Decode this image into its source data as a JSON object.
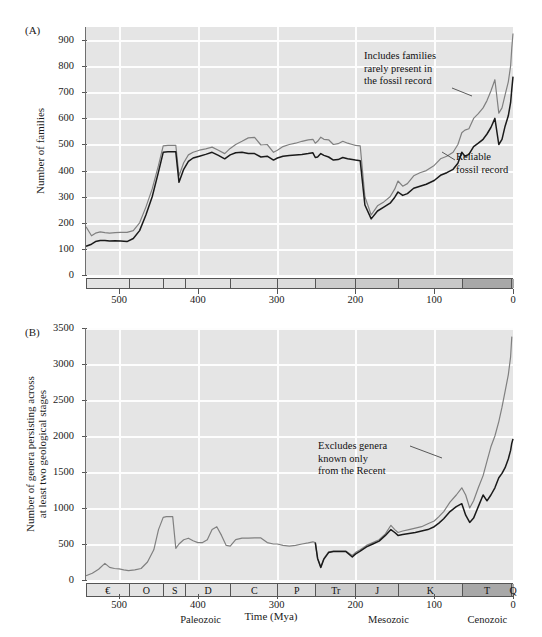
{
  "figure": {
    "panelA_label": "(A)",
    "panelB_label": "(B)",
    "xaxis_title": "Time (Mya)"
  },
  "panelA": {
    "ylabel": "Number of families",
    "yticks": [
      "0",
      "100",
      "200",
      "300",
      "400",
      "500",
      "600",
      "700",
      "800",
      "900"
    ],
    "xticks": [
      "500",
      "400",
      "300",
      "200",
      "100",
      "0"
    ],
    "annotation_upper": "Includes families rarely present in the fossil record",
    "annotation_upper_lines": [
      "Includes families",
      "rarely present in",
      "the fossil record"
    ],
    "annotation_lower": "Reliable fossil record",
    "annotation_lower_lines": [
      "Reliable",
      "fossil record"
    ]
  },
  "panelB": {
    "ylabel": "Number of genera persisting across at least two geological stages",
    "ylabel_lines": [
      "Number of genera persisting across",
      "at least two geological stages"
    ],
    "yticks": [
      "0",
      "500",
      "1000",
      "1500",
      "2000",
      "2500",
      "3000",
      "3500"
    ],
    "xticks": [
      "500",
      "400",
      "300",
      "200",
      "100",
      "0"
    ],
    "annotation": "Excludes genera known only from the Recent",
    "annotation_lines": [
      "Excludes genera",
      "known only",
      "from the Recent"
    ]
  },
  "timescale": {
    "periods": [
      {
        "abbr": "€",
        "name": "Cambrian",
        "start": 542,
        "end": 488,
        "shade": "#e3e3e3"
      },
      {
        "abbr": "O",
        "name": "Ordovician",
        "start": 488,
        "end": 444,
        "shade": "#e3e3e3"
      },
      {
        "abbr": "S",
        "name": "Silurian",
        "start": 444,
        "end": 416,
        "shade": "#e3e3e3"
      },
      {
        "abbr": "D",
        "name": "Devonian",
        "start": 416,
        "end": 359,
        "shade": "#e1e1e1"
      },
      {
        "abbr": "C",
        "name": "Carboniferous",
        "start": 359,
        "end": 299,
        "shade": "#dedede"
      },
      {
        "abbr": "P",
        "name": "Permian",
        "start": 299,
        "end": 251,
        "shade": "#dcdcdc"
      },
      {
        "abbr": "Tr",
        "name": "Triassic",
        "start": 251,
        "end": 200,
        "shade": "#cdcdcd"
      },
      {
        "abbr": "J",
        "name": "Jurassic",
        "start": 200,
        "end": 146,
        "shade": "#cacaca"
      },
      {
        "abbr": "K",
        "name": "Cretaceous",
        "start": 146,
        "end": 65,
        "shade": "#c8c8c8"
      },
      {
        "abbr": "T",
        "name": "Tertiary",
        "start": 65,
        "end": 2,
        "shade": "#a8a8a8"
      },
      {
        "abbr": "Q",
        "name": "Quaternary",
        "start": 2,
        "end": 0,
        "shade": "#a8a8a8"
      }
    ],
    "eras": [
      {
        "label": "Paleozoic",
        "start": 542,
        "end": 251
      },
      {
        "label": "Mesozoic",
        "start": 251,
        "end": 65
      },
      {
        "label": "Cenozoic",
        "start": 65,
        "end": 0
      }
    ]
  },
  "colors": {
    "plot_background": "#e5e5e5",
    "gridline": "#fdfdfd",
    "curve_total": "#808080",
    "curve_reliable": "#1a1a1a",
    "axis": "#6f6f6f"
  },
  "chart_data": [
    {
      "type": "line",
      "title": "(A) Number of families through geological time",
      "xlabel": "Time (Mya)",
      "ylabel": "Number of families",
      "xlim": [
        542,
        0
      ],
      "ylim": [
        0,
        950
      ],
      "xticks": [
        500,
        400,
        300,
        200,
        100,
        0
      ],
      "yticks": [
        0,
        100,
        200,
        300,
        400,
        500,
        600,
        700,
        800,
        900
      ],
      "grid": true,
      "x_reversed": true,
      "legend": "inline-annotations",
      "series": [
        {
          "name": "Includes families rarely present in the fossil record",
          "color": "#808080",
          "x": [
            542,
            535,
            530,
            524,
            518,
            512,
            505,
            498,
            490,
            482,
            474,
            466,
            458,
            450,
            444,
            438,
            432,
            428,
            424,
            418,
            412,
            406,
            398,
            390,
            382,
            374,
            366,
            359,
            352,
            344,
            336,
            328,
            320,
            312,
            304,
            299,
            292,
            284,
            276,
            268,
            260,
            254,
            251,
            248,
            244,
            240,
            234,
            228,
            222,
            216,
            210,
            204,
            200,
            194,
            188,
            180,
            172,
            164,
            156,
            150,
            146,
            140,
            134,
            126,
            118,
            110,
            100,
            92,
            84,
            76,
            70,
            65,
            61,
            56,
            50,
            44,
            38,
            33,
            28,
            23,
            18,
            14,
            10,
            6,
            3,
            1.5,
            0
          ],
          "y": [
            185,
            150,
            160,
            165,
            162,
            160,
            162,
            163,
            163,
            170,
            200,
            260,
            330,
            420,
            495,
            497,
            497,
            497,
            380,
            430,
            460,
            470,
            478,
            483,
            490,
            478,
            465,
            485,
            500,
            512,
            525,
            527,
            498,
            500,
            470,
            478,
            492,
            500,
            505,
            512,
            518,
            520,
            505,
            512,
            528,
            520,
            518,
            500,
            503,
            512,
            505,
            500,
            497,
            495,
            300,
            230,
            265,
            280,
            300,
            330,
            360,
            340,
            350,
            380,
            392,
            400,
            420,
            445,
            455,
            470,
            500,
            545,
            555,
            560,
            600,
            618,
            640,
            668,
            705,
            748,
            620,
            640,
            690,
            740,
            800,
            870,
            925
          ],
          "notes": "Gray upper curve: total family diversity including taxa rarely preserved."
        },
        {
          "name": "Reliable fossil record",
          "color": "#1a1a1a",
          "x": [
            542,
            535,
            530,
            524,
            518,
            512,
            505,
            498,
            490,
            482,
            474,
            466,
            458,
            450,
            444,
            438,
            432,
            428,
            424,
            418,
            412,
            406,
            398,
            390,
            382,
            374,
            366,
            359,
            352,
            344,
            336,
            328,
            320,
            312,
            304,
            299,
            292,
            284,
            276,
            268,
            260,
            254,
            251,
            248,
            244,
            240,
            234,
            228,
            222,
            216,
            210,
            204,
            200,
            194,
            188,
            180,
            172,
            164,
            156,
            150,
            146,
            140,
            134,
            126,
            118,
            110,
            100,
            92,
            84,
            76,
            70,
            65,
            61,
            56,
            50,
            44,
            38,
            33,
            28,
            23,
            18,
            14,
            10,
            6,
            3,
            1.5,
            0
          ],
          "y": [
            110,
            118,
            128,
            132,
            132,
            130,
            131,
            130,
            128,
            140,
            170,
            230,
            300,
            395,
            470,
            472,
            472,
            472,
            355,
            405,
            435,
            448,
            455,
            462,
            470,
            458,
            445,
            460,
            468,
            470,
            465,
            465,
            452,
            455,
            440,
            448,
            455,
            458,
            460,
            462,
            465,
            468,
            450,
            452,
            465,
            458,
            452,
            440,
            442,
            450,
            445,
            442,
            440,
            438,
            268,
            215,
            245,
            260,
            275,
            298,
            318,
            305,
            312,
            332,
            340,
            348,
            362,
            382,
            392,
            405,
            428,
            470,
            455,
            462,
            492,
            505,
            520,
            540,
            565,
            600,
            500,
            520,
            570,
            610,
            660,
            712,
            760
          ],
          "notes": "Black lower curve: families with a reliable fossil record."
        }
      ],
      "annotations": [
        {
          "text": "Includes families rarely present in the fossil record",
          "points_to_series": "Includes families rarely present in the fossil record",
          "x_at": 45
        },
        {
          "text": "Reliable fossil record",
          "points_to_series": "Reliable fossil record",
          "x_at": 70
        }
      ]
    },
    {
      "type": "line",
      "title": "(B) Number of genera persisting across at least two geological stages",
      "xlabel": "Time (Mya)",
      "ylabel": "Number of genera persisting across at least two geological stages",
      "xlim": [
        542,
        0
      ],
      "ylim": [
        0,
        3500
      ],
      "xticks": [
        500,
        400,
        300,
        200,
        100,
        0
      ],
      "yticks": [
        0,
        500,
        1000,
        1500,
        2000,
        2500,
        3000,
        3500
      ],
      "grid": true,
      "x_reversed": true,
      "legend": "inline-annotations",
      "series": [
        {
          "name": "All genera",
          "color": "#808080",
          "x": [
            542,
            534,
            526,
            518,
            512,
            506,
            500,
            494,
            488,
            480,
            472,
            464,
            456,
            450,
            444,
            440,
            436,
            432,
            428,
            424,
            418,
            412,
            406,
            400,
            394,
            388,
            382,
            376,
            370,
            364,
            359,
            352,
            344,
            336,
            328,
            320,
            312,
            304,
            299,
            292,
            284,
            276,
            268,
            260,
            254,
            251,
            248,
            244,
            240,
            234,
            228,
            220,
            212,
            204,
            200,
            194,
            186,
            178,
            170,
            162,
            155,
            150,
            146,
            140,
            132,
            124,
            116,
            108,
            100,
            94,
            88,
            80,
            72,
            65,
            60,
            55,
            50,
            44,
            38,
            33,
            28,
            23,
            18,
            14,
            10,
            6,
            3,
            1.5,
            0
          ],
          "y": [
            60,
            95,
            150,
            230,
            175,
            160,
            155,
            140,
            130,
            140,
            160,
            250,
            420,
            700,
            870,
            880,
            880,
            880,
            440,
            500,
            560,
            580,
            545,
            520,
            520,
            560,
            700,
            740,
            620,
            480,
            470,
            560,
            580,
            580,
            585,
            585,
            520,
            500,
            500,
            480,
            470,
            480,
            500,
            515,
            530,
            520,
            300,
            180,
            300,
            390,
            400,
            400,
            400,
            340,
            380,
            420,
            480,
            520,
            560,
            640,
            760,
            700,
            660,
            680,
            700,
            720,
            740,
            780,
            820,
            880,
            950,
            1080,
            1180,
            1280,
            1180,
            1000,
            1100,
            1280,
            1450,
            1650,
            1850,
            2000,
            2200,
            2400,
            2620,
            2850,
            3100,
            3380
          ],
          "notes": "Gray upper curve in panel B."
        },
        {
          "name": "Excludes genera known only from the Recent",
          "color": "#1a1a1a",
          "x": [
            251,
            248,
            244,
            240,
            234,
            228,
            220,
            212,
            204,
            200,
            194,
            186,
            178,
            170,
            162,
            155,
            150,
            146,
            140,
            132,
            124,
            116,
            108,
            100,
            94,
            88,
            80,
            72,
            65,
            60,
            55,
            50,
            44,
            38,
            33,
            28,
            23,
            18,
            14,
            10,
            6,
            3,
            1.5,
            0
          ],
          "y": [
            520,
            300,
            175,
            290,
            380,
            395,
            395,
            395,
            320,
            360,
            400,
            460,
            500,
            540,
            620,
            700,
            660,
            620,
            630,
            645,
            660,
            680,
            700,
            740,
            790,
            850,
            950,
            1020,
            1060,
            900,
            800,
            860,
            1020,
            1180,
            1100,
            1180,
            1280,
            1420,
            1480,
            1560,
            1680,
            1800,
            1900,
            1960
          ],
          "notes": "Black lower curve in panel B, begins near the Permian-Triassic boundary."
        }
      ],
      "annotations": [
        {
          "text": "Excludes genera known only from the Recent",
          "points_to_series": "Excludes genera known only from the Recent",
          "x_at": 75
        }
      ]
    }
  ]
}
